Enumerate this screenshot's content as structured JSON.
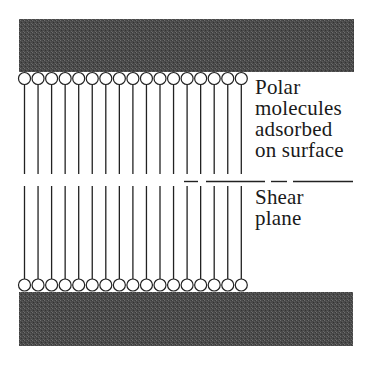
{
  "diagram": {
    "title": "",
    "colors": {
      "plate_fill": "#4a4a4a",
      "plate_noise": "#6b6b6b",
      "line": "#222222",
      "background": "#ffffff"
    },
    "top_plate": {
      "x": 19,
      "y": 19,
      "width": 335,
      "height": 53
    },
    "bottom_plate": {
      "x": 19,
      "y": 292,
      "width": 334,
      "height": 54
    },
    "molecules": {
      "count_per_surface": 17,
      "first_center_x": 24.5,
      "spacing": 13.55,
      "head_radius": 6,
      "top_head_cy": 78.5,
      "top_tail_end_y": 174,
      "bottom_head_cy": 285,
      "bottom_tail_start_y": 186
    },
    "shear_plane_segments": [
      {
        "x1": 184,
        "x2": 198
      },
      {
        "x1": 206,
        "x2": 265
      },
      {
        "x1": 271,
        "x2": 287
      },
      {
        "x1": 293,
        "x2": 353
      }
    ],
    "shear_plane_y": 181.5
  },
  "labels": {
    "polar_line1": "Polar",
    "polar_line2": "molecules",
    "polar_line3": "adsorbed",
    "polar_line4": "on surface",
    "shear_line1": "Shear",
    "shear_line2": "plane"
  }
}
